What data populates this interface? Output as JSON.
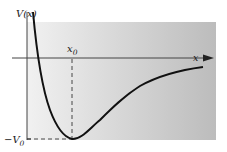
{
  "figure": {
    "labels": {
      "y_axis": "V(x)",
      "x_axis": "x",
      "x0_main": "x",
      "x0_sub": "0",
      "v0_prefix": "−V",
      "v0_sub": "0"
    },
    "colors": {
      "panel_left": "#f1f1f1",
      "panel_right": "#bcbcbc",
      "axis": "#444444",
      "curve": "#111111",
      "dash": "#333333",
      "text": "#1a1a1a"
    },
    "curve": {
      "description": "Potential well: steep repulsive wall at small x, minimum value -V0 at x = x0, rising asymptotically toward 0 as x increases",
      "minimum": {
        "x": "x0",
        "V": "-V0"
      }
    }
  }
}
